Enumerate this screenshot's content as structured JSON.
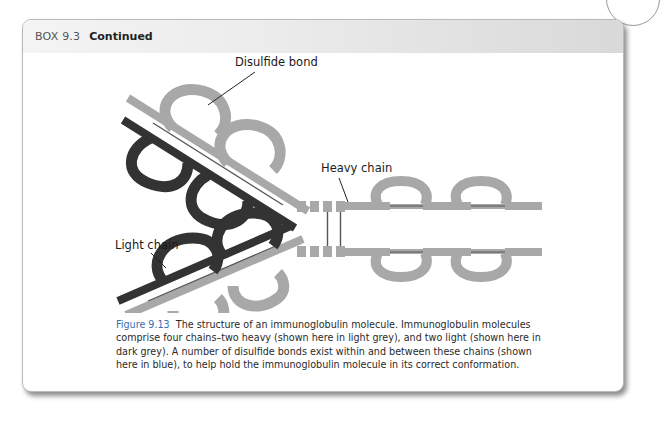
{
  "box": {
    "label": "BOX 9.3",
    "title": "Continued"
  },
  "figure": {
    "labels": {
      "disulfide_bond": "Disulfide bond",
      "heavy_chain": "Heavy chain",
      "light_chain": "Light chain"
    },
    "colors": {
      "heavy_chain": "#a8a8a8",
      "light_chain": "#333333",
      "disulfide_bond": "#555555"
    }
  },
  "caption": {
    "number": "Figure 9.13",
    "text": "The structure of an immunoglobulin molecule. Immunoglobulin molecules comprise four chains–two heavy (shown here in light grey), and two light (shown here in dark grey). A number of disulfide bonds exist within and between these chains (shown here in blue), to help hold the immunoglobulin molecule in its correct conformation."
  }
}
